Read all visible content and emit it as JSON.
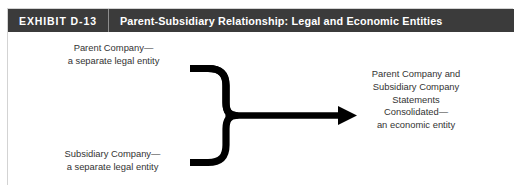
{
  "exhibit": {
    "number": "EXHIBIT D-13",
    "title": "Parent-Subsidiary Relationship: Legal and Economic Entities",
    "header_background": "#3b3b3b",
    "header_text_color": "#ffffff",
    "body_text_color": "#333333",
    "diagram_color": "#000000"
  },
  "diagram": {
    "left_inputs": [
      {
        "id": "parent-company",
        "lines": [
          "Parent Company—",
          "a separate legal entity"
        ]
      },
      {
        "id": "subsidiary-company",
        "lines": [
          "Subsidiary Company—",
          "a separate legal entity"
        ]
      }
    ],
    "connector": {
      "shape": "right-facing-curly-brace",
      "arrow": "single-headed-arrow-pointing-right"
    },
    "result": {
      "id": "consolidated-statements",
      "lines": [
        "Parent Company and",
        "Subsidiary Company",
        "Statements",
        "Consolidated—",
        "an economic entity"
      ]
    }
  }
}
